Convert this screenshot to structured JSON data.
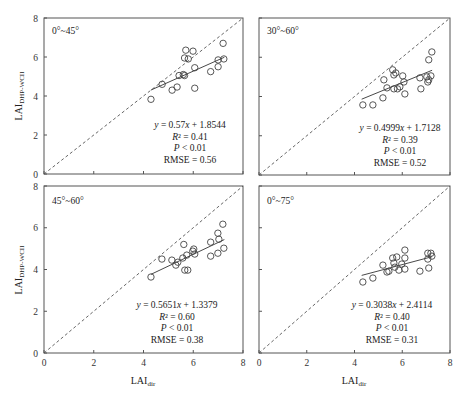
{
  "chart_data": [
    {
      "type": "scatter",
      "title": "0°~45°",
      "xlabel": "LAI_dir",
      "ylabel": "LAI_DHP-WCII",
      "xlim": [
        0,
        8
      ],
      "ylim": [
        0,
        8
      ],
      "xticks": [
        0,
        2,
        4,
        6,
        8
      ],
      "yticks": [
        0,
        2,
        4,
        6,
        8
      ],
      "reference_line": "1:1",
      "fit": {
        "slope": 0.57,
        "intercept": 1.8544,
        "x_range": [
          4.3,
          7.25
        ]
      },
      "annotation": [
        "y = 0.57x + 1.8544",
        "R² = 0.41",
        "P < 0.01",
        "RMSE = 0.56"
      ],
      "points": [
        [
          4.3,
          3.83
        ],
        [
          4.75,
          4.6
        ],
        [
          5.15,
          4.3
        ],
        [
          5.35,
          4.46
        ],
        [
          5.43,
          5.05
        ],
        [
          5.6,
          5.1
        ],
        [
          5.65,
          5.05
        ],
        [
          5.65,
          5.95
        ],
        [
          5.7,
          6.35
        ],
        [
          5.8,
          5.9
        ],
        [
          5.99,
          6.3
        ],
        [
          6.06,
          5.45
        ],
        [
          6.06,
          4.4
        ],
        [
          6.7,
          5.25
        ],
        [
          7.0,
          5.5
        ],
        [
          7.0,
          5.85
        ],
        [
          7.2,
          6.7
        ],
        [
          7.23,
          5.9
        ]
      ]
    },
    {
      "type": "scatter",
      "title": "30°~60°",
      "xlabel": "",
      "ylabel": "",
      "xlim": [
        0,
        8
      ],
      "ylim": [
        0,
        8
      ],
      "xticks": [
        0,
        2,
        4,
        6,
        8
      ],
      "yticks": [
        0,
        2,
        4,
        6,
        8
      ],
      "reference_line": "1:1",
      "fit": {
        "slope": 0.4999,
        "intercept": 1.7128,
        "x_range": [
          4.3,
          7.25
        ]
      },
      "annotation": [
        "y = 0.4999x + 1.7128",
        "R² = 0.39",
        "P < 0.01",
        "RMSE = 0.52"
      ],
      "points": [
        [
          4.35,
          3.57
        ],
        [
          4.77,
          3.57
        ],
        [
          5.19,
          3.93
        ],
        [
          5.23,
          4.85
        ],
        [
          5.36,
          4.44
        ],
        [
          5.6,
          5.36
        ],
        [
          5.65,
          5.1
        ],
        [
          5.65,
          4.39
        ],
        [
          5.73,
          5.2
        ],
        [
          5.8,
          4.39
        ],
        [
          5.9,
          4.49
        ],
        [
          6.02,
          5.05
        ],
        [
          6.07,
          4.74
        ],
        [
          6.11,
          4.13
        ],
        [
          6.74,
          4.95
        ],
        [
          6.78,
          4.39
        ],
        [
          7.03,
          5.0
        ],
        [
          7.11,
          5.87
        ],
        [
          7.07,
          4.74
        ],
        [
          7.11,
          4.85
        ],
        [
          7.2,
          5.05
        ],
        [
          7.24,
          6.27
        ]
      ]
    },
    {
      "type": "scatter",
      "title": "45°~60°",
      "xlabel": "LAI_dir",
      "ylabel": "LAI_DHP-WCII",
      "xlim": [
        0,
        8
      ],
      "ylim": [
        0,
        8
      ],
      "xticks": [
        0,
        2,
        4,
        6,
        8
      ],
      "yticks": [
        0,
        2,
        4,
        6,
        8
      ],
      "reference_line": "1:1",
      "fit": {
        "slope": 0.5651,
        "intercept": 1.3379,
        "x_range": [
          4.3,
          7.25
        ]
      },
      "annotation": [
        "y = 0.5651x + 1.3379",
        "R² = 0.60",
        "P < 0.01",
        "RMSE = 0.38"
      ],
      "points": [
        [
          4.3,
          3.64
        ],
        [
          4.74,
          4.5
        ],
        [
          5.14,
          4.45
        ],
        [
          5.3,
          4.21
        ],
        [
          5.38,
          4.35
        ],
        [
          5.58,
          4.55
        ],
        [
          5.62,
          5.2
        ],
        [
          5.66,
          3.97
        ],
        [
          5.78,
          3.97
        ],
        [
          5.74,
          4.69
        ],
        [
          5.98,
          4.88
        ],
        [
          6.02,
          4.98
        ],
        [
          6.06,
          4.74
        ],
        [
          6.7,
          5.31
        ],
        [
          6.7,
          4.64
        ],
        [
          6.99,
          4.78
        ],
        [
          6.99,
          5.74
        ],
        [
          7.03,
          5.45
        ],
        [
          7.19,
          6.17
        ],
        [
          7.23,
          5.02
        ]
      ]
    },
    {
      "type": "scatter",
      "title": "0°~75°",
      "xlabel": "LAI_dir",
      "ylabel": "",
      "xlim": [
        0,
        8
      ],
      "ylim": [
        0,
        8
      ],
      "xticks": [
        0,
        2,
        4,
        6,
        8
      ],
      "yticks": [
        0,
        2,
        4,
        6,
        8
      ],
      "reference_line": "1:1",
      "fit": {
        "slope": 0.3038,
        "intercept": 2.4114,
        "x_range": [
          4.3,
          7.25
        ]
      },
      "annotation": [
        "y = 0.3038x + 2.4114",
        "R² = 0.40",
        "P < 0.01",
        "RMSE = 0.31"
      ],
      "points": [
        [
          4.35,
          3.4
        ],
        [
          4.77,
          3.59
        ],
        [
          5.19,
          4.21
        ],
        [
          5.36,
          3.88
        ],
        [
          5.44,
          3.92
        ],
        [
          5.6,
          4.55
        ],
        [
          5.65,
          4.31
        ],
        [
          5.69,
          4.11
        ],
        [
          5.77,
          4.6
        ],
        [
          5.86,
          3.97
        ],
        [
          5.98,
          4.26
        ],
        [
          6.11,
          4.93
        ],
        [
          6.11,
          4.55
        ],
        [
          6.11,
          4.02
        ],
        [
          6.74,
          3.92
        ],
        [
          7.07,
          4.78
        ],
        [
          7.07,
          4.5
        ],
        [
          7.11,
          4.07
        ],
        [
          7.2,
          4.78
        ],
        [
          7.24,
          4.64
        ]
      ]
    }
  ],
  "layout": {
    "panels": [
      {
        "x0": 44,
        "x1": 243,
        "y0": 174,
        "y1": 18,
        "show_yticklabels": true,
        "show_xticklabels": false,
        "title_x": 52,
        "title_y": 34,
        "ann_x": 190,
        "ann_y": 128
      },
      {
        "x0": 259,
        "x1": 450,
        "y0": 175,
        "y1": 18,
        "show_yticklabels": false,
        "show_xticklabels": false,
        "title_x": 267,
        "title_y": 34,
        "ann_x": 400,
        "ann_y": 131
      },
      {
        "x0": 44,
        "x1": 243,
        "y0": 353,
        "y1": 186,
        "show_yticklabels": true,
        "show_xticklabels": true,
        "title_x": 52,
        "title_y": 204,
        "ann_x": 177,
        "ann_y": 308
      },
      {
        "x0": 259,
        "x1": 450,
        "y0": 353,
        "y1": 186,
        "show_yticklabels": false,
        "show_xticklabels": true,
        "title_x": 267,
        "title_y": 204,
        "ann_x": 392,
        "ann_y": 308
      }
    ],
    "colors": {
      "frame": "#555555",
      "points": "#444444",
      "fit": "#333333",
      "ref": "#555555"
    }
  }
}
